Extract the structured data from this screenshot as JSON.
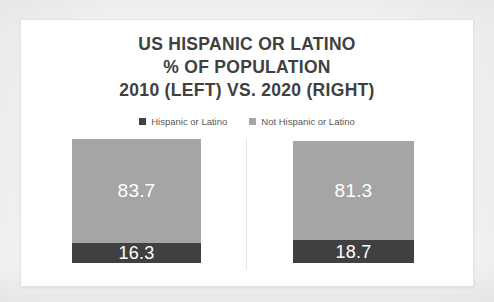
{
  "chart_data": {
    "type": "bar",
    "subtype": "100% stacked bar",
    "title": "US HISPANIC OR LATINO % OF POPULATION 2010 (LEFT) VS. 2020 (RIGHT)",
    "title_lines": [
      "US HISPANIC OR LATINO",
      "% OF POPULATION",
      "2010 (LEFT) VS. 2020 (RIGHT)"
    ],
    "xlabel": "",
    "ylabel": "",
    "ylim": [
      0,
      100
    ],
    "grid": false,
    "legend_position": "top-center",
    "categories": [
      "2010",
      "2020"
    ],
    "series": [
      {
        "name": "Hispanic or Latino",
        "color": "#404040",
        "values": [
          16.3,
          18.7
        ]
      },
      {
        "name": "Not Hispanic or Latino",
        "color": "#a5a5a5",
        "values": [
          83.7,
          81.3
        ]
      }
    ],
    "panels": [
      {
        "category": "2010",
        "segments": [
          {
            "series": "Not Hispanic or Latino",
            "value": 83.7,
            "label": "83.7"
          },
          {
            "series": "Hispanic or Latino",
            "value": 16.3,
            "label": "16.3"
          }
        ]
      },
      {
        "category": "2020",
        "segments": [
          {
            "series": "Not Hispanic or Latino",
            "value": 81.3,
            "label": "81.3"
          },
          {
            "series": "Hispanic or Latino",
            "value": 18.7,
            "label": "18.7"
          }
        ]
      }
    ],
    "data_label_color": "#ffffff"
  },
  "chart": {
    "title": {
      "line1": "US HISPANIC OR LATINO",
      "line2": "% OF POPULATION",
      "line3": "2010 (LEFT) VS. 2020 (RIGHT)"
    },
    "legend": {
      "items": [
        {
          "label": "Hispanic or Latino",
          "color": "#404040"
        },
        {
          "label": "Not Hispanic or Latino",
          "color": "#a5a5a5"
        }
      ]
    },
    "bars": {
      "left": {
        "top_label": "83.7",
        "bottom_label": "16.3"
      },
      "right": {
        "top_label": "81.3",
        "bottom_label": "18.7"
      }
    }
  },
  "colors": {
    "hispanic": "#404040",
    "not_hispanic": "#a5a5a5",
    "title_text": "#404040",
    "legend_text": "#595959",
    "card_background": "#ffffff",
    "card_border": "#e3e3e3",
    "page_background": "#f2f1ef"
  }
}
